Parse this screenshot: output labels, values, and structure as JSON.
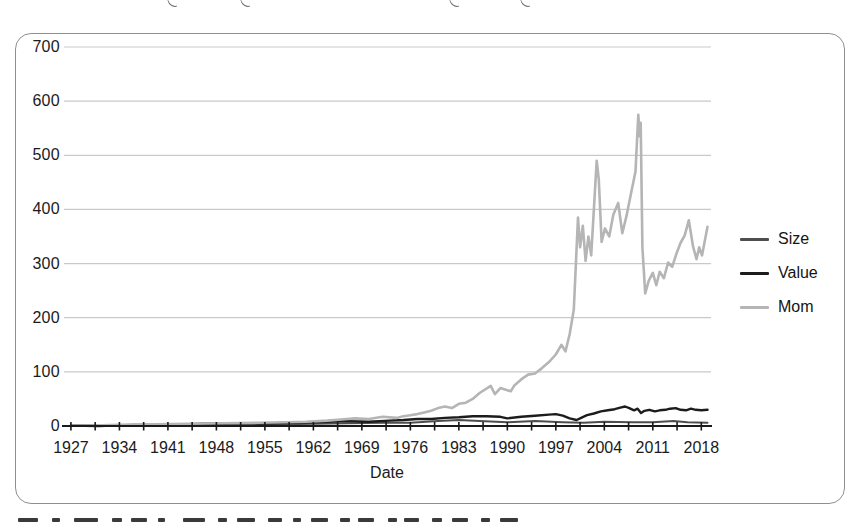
{
  "chart_data": {
    "type": "line",
    "title": "",
    "xlabel": "Date",
    "ylabel": "",
    "xlim": [
      1926,
      2019.4
    ],
    "ylim": [
      0,
      700
    ],
    "x_tick_labels": [
      1927,
      1934,
      1941,
      1948,
      1955,
      1962,
      1969,
      1976,
      1983,
      1990,
      1997,
      2004,
      2011,
      2018
    ],
    "minor_tick_step_years": 3.5,
    "y_tick_labels": [
      0,
      100,
      200,
      300,
      400,
      500,
      600,
      700
    ],
    "grid": "horizontal",
    "colors": {
      "grid": "#c9c9c9",
      "axis": "#1a1a1a",
      "panel_border": "#8f8f8f",
      "tick_text": "#1b1b1b"
    },
    "legend": {
      "position": "right-outside",
      "entries": [
        "Size",
        "Value",
        "Mom"
      ]
    },
    "series": [
      {
        "name": "Size",
        "color": "#4e4e4e",
        "stroke_width": 2,
        "points": [
          [
            1927,
            1
          ],
          [
            1932,
            1
          ],
          [
            1940,
            2
          ],
          [
            1948,
            2
          ],
          [
            1955,
            3
          ],
          [
            1962,
            4
          ],
          [
            1967,
            5
          ],
          [
            1972,
            6
          ],
          [
            1976,
            6
          ],
          [
            1980,
            9
          ],
          [
            1983,
            11
          ],
          [
            1986,
            9
          ],
          [
            1990,
            7
          ],
          [
            1994,
            9
          ],
          [
            1998,
            7
          ],
          [
            2001,
            6
          ],
          [
            2004,
            8
          ],
          [
            2008,
            7
          ],
          [
            2011,
            7
          ],
          [
            2014,
            9
          ],
          [
            2016,
            7
          ],
          [
            2018.9,
            6
          ]
        ]
      },
      {
        "name": "Value",
        "color": "#1c1c1c",
        "stroke_width": 2.4,
        "points": [
          [
            1927,
            1
          ],
          [
            1931,
            0
          ],
          [
            1936,
            2
          ],
          [
            1941,
            2
          ],
          [
            1946,
            4
          ],
          [
            1951,
            5
          ],
          [
            1956,
            5
          ],
          [
            1961,
            7
          ],
          [
            1964,
            8
          ],
          [
            1967,
            9
          ],
          [
            1970,
            8
          ],
          [
            1973,
            10
          ],
          [
            1975,
            11
          ],
          [
            1977,
            13
          ],
          [
            1979,
            13
          ],
          [
            1981,
            15
          ],
          [
            1983,
            16
          ],
          [
            1985,
            18
          ],
          [
            1987,
            18
          ],
          [
            1989,
            17
          ],
          [
            1990,
            14
          ],
          [
            1992,
            17
          ],
          [
            1994,
            19
          ],
          [
            1996,
            21
          ],
          [
            1997,
            22
          ],
          [
            1998,
            19
          ],
          [
            1999,
            14
          ],
          [
            2000,
            11
          ],
          [
            2000.8,
            16
          ],
          [
            2001.5,
            20
          ],
          [
            2002.5,
            23
          ],
          [
            2003.5,
            27
          ],
          [
            2004.5,
            29
          ],
          [
            2005.5,
            31
          ],
          [
            2006.3,
            34
          ],
          [
            2007,
            36
          ],
          [
            2007.6,
            33
          ],
          [
            2008.3,
            29
          ],
          [
            2008.8,
            32
          ],
          [
            2009.3,
            24
          ],
          [
            2009.8,
            28
          ],
          [
            2010.5,
            30
          ],
          [
            2011.3,
            27
          ],
          [
            2012,
            29
          ],
          [
            2012.8,
            30
          ],
          [
            2013.5,
            32
          ],
          [
            2014.3,
            33
          ],
          [
            2015,
            30
          ],
          [
            2015.8,
            29
          ],
          [
            2016.5,
            32
          ],
          [
            2017.2,
            30
          ],
          [
            2018,
            29
          ],
          [
            2018.9,
            30
          ]
        ]
      },
      {
        "name": "Mom",
        "color": "#b5b5b5",
        "stroke_width": 2.6,
        "points": [
          [
            1927,
            1
          ],
          [
            1930,
            1
          ],
          [
            1934,
            2
          ],
          [
            1939,
            3
          ],
          [
            1944,
            4
          ],
          [
            1949,
            5
          ],
          [
            1954,
            6
          ],
          [
            1958,
            7
          ],
          [
            1961,
            8
          ],
          [
            1964,
            10
          ],
          [
            1966,
            12
          ],
          [
            1968,
            14
          ],
          [
            1970,
            13
          ],
          [
            1972,
            17
          ],
          [
            1974,
            15
          ],
          [
            1975,
            18
          ],
          [
            1976,
            20
          ],
          [
            1977,
            22
          ],
          [
            1978,
            25
          ],
          [
            1979,
            28
          ],
          [
            1980,
            33
          ],
          [
            1981,
            36
          ],
          [
            1982,
            33
          ],
          [
            1983,
            41
          ],
          [
            1984,
            43
          ],
          [
            1985,
            50
          ],
          [
            1986,
            61
          ],
          [
            1987.6,
            74
          ],
          [
            1988.2,
            59
          ],
          [
            1989,
            70
          ],
          [
            1990.5,
            64
          ],
          [
            1991,
            75
          ],
          [
            1992,
            86
          ],
          [
            1993,
            95
          ],
          [
            1994,
            97
          ],
          [
            1995,
            107
          ],
          [
            1996,
            118
          ],
          [
            1997,
            132
          ],
          [
            1997.8,
            150
          ],
          [
            1998.4,
            138
          ],
          [
            1999,
            170
          ],
          [
            1999.6,
            215
          ],
          [
            2000.2,
            385
          ],
          [
            2000.5,
            330
          ],
          [
            2000.9,
            370
          ],
          [
            2001.3,
            305
          ],
          [
            2001.7,
            350
          ],
          [
            2002.1,
            315
          ],
          [
            2002.9,
            490
          ],
          [
            2003.2,
            455
          ],
          [
            2003.6,
            340
          ],
          [
            2004.1,
            365
          ],
          [
            2004.7,
            350
          ],
          [
            2005.3,
            390
          ],
          [
            2006,
            412
          ],
          [
            2006.6,
            356
          ],
          [
            2007.2,
            388
          ],
          [
            2007.9,
            432
          ],
          [
            2008.5,
            470
          ],
          [
            2008.9,
            575
          ],
          [
            2009.1,
            535
          ],
          [
            2009.25,
            560
          ],
          [
            2009.5,
            330
          ],
          [
            2009.9,
            245
          ],
          [
            2010.4,
            268
          ],
          [
            2011,
            283
          ],
          [
            2011.5,
            260
          ],
          [
            2012,
            285
          ],
          [
            2012.6,
            273
          ],
          [
            2013.2,
            302
          ],
          [
            2013.8,
            294
          ],
          [
            2014.4,
            318
          ],
          [
            2015,
            338
          ],
          [
            2015.6,
            352
          ],
          [
            2016.2,
            380
          ],
          [
            2016.8,
            332
          ],
          [
            2017.3,
            308
          ],
          [
            2017.7,
            330
          ],
          [
            2018.1,
            315
          ],
          [
            2018.9,
            368
          ]
        ]
      }
    ]
  }
}
